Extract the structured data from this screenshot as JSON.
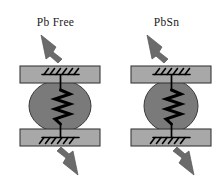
{
  "figure": {
    "background_color": "#ffffff",
    "line_color": "#000000",
    "pad_color": "#a8a8a8",
    "pad_edge_color": "#3a3a3a",
    "ball_color": "#7a7a7a",
    "ball_edge_color": "#3a3a3a",
    "arrow_color": "#6b6b6b",
    "arrow_edge_color": "#4a4a4a"
  },
  "panels": [
    {
      "id": "pbfree",
      "label": "Pb Free",
      "ball": {
        "shape": "ellipse",
        "rx": 31,
        "ry": 26,
        "cx": 60,
        "cy": 106
      },
      "top_pad": {
        "x": 20,
        "y": 66,
        "width": 80,
        "height": 17
      },
      "bottom_pad": {
        "x": 20,
        "y": 129,
        "width": 80,
        "height": 17
      },
      "spring": {
        "coils": 4,
        "amplitude": 9,
        "stroke_width": 3
      },
      "top_support": {
        "hatch_count": 6,
        "direction": "up"
      },
      "bottom_support": {
        "hatch_count": 6,
        "direction": "down"
      },
      "arrow_top": {
        "direction": "up-left"
      },
      "arrow_bottom": {
        "direction": "down-right"
      }
    },
    {
      "id": "pbsn",
      "label": "PbSn",
      "ball": {
        "shape": "ellipse",
        "rx": 27,
        "ry": 26,
        "cx": 60,
        "cy": 106
      },
      "top_pad": {
        "x": 20,
        "y": 66,
        "width": 80,
        "height": 17
      },
      "bottom_pad": {
        "x": 20,
        "y": 129,
        "width": 80,
        "height": 17
      },
      "spring": {
        "coils": 4,
        "amplitude": 9,
        "stroke_width": 3
      },
      "top_support": {
        "hatch_count": 6,
        "direction": "up"
      },
      "bottom_support": {
        "hatch_count": 6,
        "direction": "down"
      },
      "arrow_top": {
        "direction": "up-left"
      },
      "arrow_bottom": {
        "direction": "down-right"
      }
    }
  ]
}
